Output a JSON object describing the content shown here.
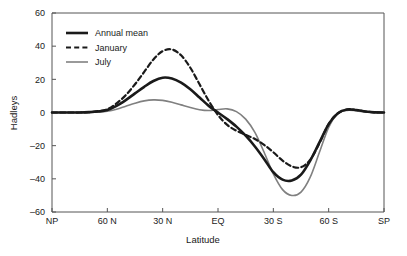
{
  "chart_data": {
    "type": "line",
    "title": "",
    "xlabel": "Latitude",
    "ylabel": "Hadleys",
    "xlim": [
      90,
      -90
    ],
    "ylim": [
      -60,
      60
    ],
    "grid": false,
    "legend_position": "top-left",
    "xticks": [
      90,
      60,
      30,
      0,
      -30,
      -60,
      -90
    ],
    "xticklabels": [
      "NP",
      "60 N",
      "30 N",
      "EQ",
      "30 S",
      "60 S",
      "SP"
    ],
    "yticks": [
      60,
      40,
      20,
      0,
      -20,
      -40,
      -60
    ],
    "yticklabels": [
      "60",
      "40",
      "20",
      "0",
      "-20",
      "-40",
      "-60"
    ],
    "x": [
      90,
      85,
      80,
      75,
      70,
      65,
      60,
      55,
      50,
      45,
      40,
      35,
      30,
      25,
      20,
      15,
      10,
      5,
      0,
      -5,
      -10,
      -15,
      -20,
      -25,
      -30,
      -35,
      -40,
      -45,
      -50,
      -55,
      -60,
      -65,
      -70,
      -75,
      -80,
      -85,
      -90
    ],
    "series": [
      {
        "name": "Annual mean",
        "color": "#1a1a1a",
        "style": "solid",
        "width": 2.6,
        "values": [
          0,
          0,
          0,
          0,
          0.2,
          0.6,
          1.5,
          4.0,
          7.5,
          11.5,
          15.5,
          19.0,
          21.0,
          20.5,
          18.0,
          14.0,
          9.0,
          4.0,
          0.0,
          -4.0,
          -8.5,
          -14.0,
          -20.5,
          -28.0,
          -36.0,
          -40.5,
          -41.0,
          -37.5,
          -29.0,
          -18.0,
          -7.0,
          -0.5,
          1.8,
          1.5,
          0.6,
          0.1,
          0
        ]
      },
      {
        "name": "January",
        "color": "#1a1a1a",
        "style": "dashed",
        "width": 2.2,
        "values": [
          0,
          0,
          0,
          0,
          0.2,
          0.8,
          2.0,
          5.5,
          10.5,
          17.0,
          24.5,
          32.0,
          37.0,
          38.0,
          34.5,
          27.0,
          17.0,
          7.0,
          -1.5,
          -7.5,
          -11.0,
          -13.5,
          -16.0,
          -19.5,
          -24.0,
          -29.0,
          -32.5,
          -33.0,
          -28.5,
          -18.5,
          -7.0,
          -0.5,
          1.8,
          1.5,
          0.6,
          0.1,
          0
        ]
      },
      {
        "name": "July",
        "color": "#808080",
        "style": "solid",
        "width": 1.6,
        "values": [
          0,
          0,
          0,
          0,
          0.1,
          0.3,
          0.8,
          2.0,
          3.8,
          5.6,
          7.0,
          7.6,
          7.3,
          6.2,
          4.6,
          3.0,
          1.7,
          1.2,
          1.8,
          2.2,
          0.5,
          -4.0,
          -12.0,
          -24.0,
          -37.0,
          -46.5,
          -50.0,
          -48.0,
          -39.0,
          -24.0,
          -9.0,
          -0.5,
          1.3,
          1.0,
          0.4,
          0.1,
          0
        ]
      }
    ]
  },
  "axes": {
    "ylabel": "Hadleys",
    "xlabel": "Latitude"
  },
  "legend": {
    "entries": [
      {
        "label": "Annual mean"
      },
      {
        "label": "January"
      },
      {
        "label": "July"
      }
    ]
  }
}
